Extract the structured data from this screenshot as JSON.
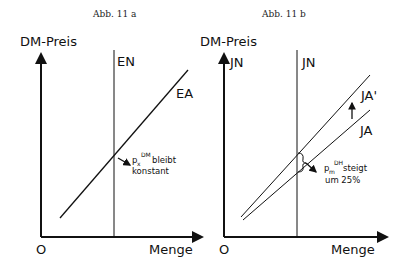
{
  "figure_a": {
    "caption": "Abb. 11 a",
    "y_axis_label": "DM-Preis",
    "x_axis_label": "Menge",
    "origin_label": "O",
    "curves": {
      "vertical": "EN",
      "sloped": "EA"
    },
    "annotation": {
      "symbol": "p",
      "subscript": "x",
      "superscript": "DM",
      "line1_rest": "bleibt",
      "line2": "konstant"
    }
  },
  "figure_b": {
    "caption": "Abb. 11 b",
    "y_axis_label": "DM-Preis",
    "x_axis_label": "Menge",
    "origin_label": "O",
    "curves": {
      "vertical_axis_label": "JN",
      "vertical": "JN",
      "shifted": "JA'",
      "original": "JA"
    },
    "annotation": {
      "symbol": "p",
      "subscript": "m",
      "superscript": "DH",
      "line1_rest": "steigt",
      "line2": "um 25%"
    }
  },
  "colors": {
    "ink": "#111111",
    "background": "#ffffff"
  }
}
